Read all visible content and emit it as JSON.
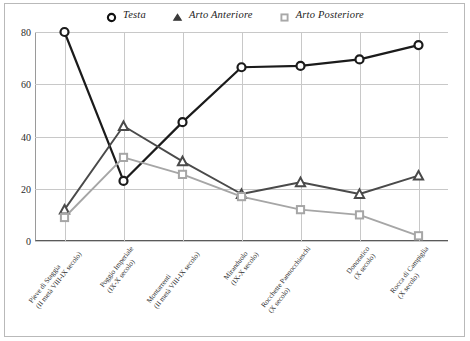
{
  "chart_data": {
    "type": "line",
    "title": "",
    "xlabel": "",
    "ylabel": "",
    "ylim": [
      0,
      80
    ],
    "yticks": [
      0,
      20,
      40,
      60,
      80
    ],
    "grid": true,
    "legend_position": "top-center",
    "categories": [
      "Pieve di Staggia (II metà VIII-IX secolo)",
      "Poggio Imperiale (IX-X secolo)",
      "Montarrenti (II metà VIII-IX secolo)",
      "Miranduolo (IX-X secolo)",
      "Rocchette Pannocchieschi (X secolo)",
      "Donoratico (X secolo)",
      "Rocca di Campiglia (X secolo)"
    ],
    "categories_lines": [
      [
        "Pieve di Staggia",
        "(II metà VIII-IX secolo)"
      ],
      [
        "Poggio Imperiale",
        "(IX-X secolo)"
      ],
      [
        "Montarrenti",
        "(II metà VIII-IX secolo)"
      ],
      [
        "Miranduolo",
        "(IX-X secolo)"
      ],
      [
        "Rocchette Pannocchieschi",
        "(X secolo)"
      ],
      [
        "Donoratico",
        "(X secolo)"
      ],
      [
        "Rocca di Campiglia",
        "(X secolo)"
      ]
    ],
    "series": [
      {
        "name": "Testa",
        "marker": "circle-open",
        "color": "#1b1b1b",
        "values": [
          80,
          23,
          45.5,
          66.5,
          67,
          69.5,
          75
        ]
      },
      {
        "name": "Arto Anteriore",
        "marker": "triangle-filled",
        "color": "#4a4a4a",
        "values": [
          12,
          44,
          30.5,
          18,
          22.5,
          18,
          25
        ]
      },
      {
        "name": "Arto Posteriore",
        "marker": "square-open",
        "color": "#a6a6a6",
        "values": [
          9,
          32,
          25.5,
          17,
          12,
          10,
          2
        ]
      }
    ]
  },
  "legend": {
    "items": [
      {
        "label": "Testa",
        "marker": "circle-open"
      },
      {
        "label": "Arto Anteriore",
        "marker": "triangle-filled"
      },
      {
        "label": "Arto Posteriore",
        "marker": "square-open"
      }
    ]
  },
  "axis": {
    "ytick_labels": [
      "0",
      "20",
      "40",
      "60",
      "80"
    ]
  }
}
